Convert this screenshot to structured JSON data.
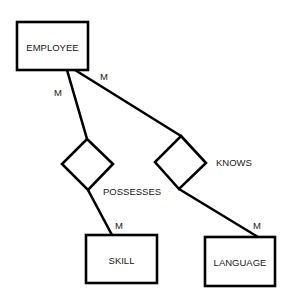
{
  "diagram": {
    "type": "er-diagram",
    "stroke_color": "#000000",
    "text_color": "#1a1a1a",
    "background": "#ffffff",
    "entities": [
      {
        "id": "employee",
        "label": "EMPLOYEE",
        "x": 17,
        "y": 22,
        "w": 71,
        "h": 48
      },
      {
        "id": "skill",
        "label": "SKILL",
        "x": 86,
        "y": 235,
        "w": 71,
        "h": 48
      },
      {
        "id": "language",
        "label": "LANGUAGE",
        "x": 205,
        "y": 237,
        "w": 70,
        "h": 49
      }
    ],
    "relationships": [
      {
        "id": "possesses",
        "label": "POSSESSES",
        "top": [
          87,
          139
        ],
        "right": [
          113,
          164
        ],
        "bottom": [
          88,
          190
        ],
        "left": [
          62,
          164
        ],
        "label_pos": [
          103,
          191
        ]
      },
      {
        "id": "knows",
        "label": "KNOWS",
        "top": [
          181,
          136
        ],
        "right": [
          206,
          163
        ],
        "bottom": [
          179,
          189
        ],
        "left": [
          155,
          162
        ],
        "label_pos": [
          216,
          162
        ]
      }
    ],
    "connections": [
      {
        "id": "employee-possesses",
        "from": [
          67,
          70
        ],
        "to": [
          87,
          139
        ]
      },
      {
        "id": "employee-knows",
        "from": [
          75,
          70
        ],
        "to": [
          181,
          136
        ]
      },
      {
        "id": "possesses-skill",
        "from": [
          88,
          190
        ],
        "to": [
          112,
          235
        ]
      },
      {
        "id": "knows-language",
        "from": [
          179,
          189
        ],
        "to": [
          258,
          237
        ]
      }
    ],
    "cardinalities": [
      {
        "id": "card-employee-possesses",
        "label": "M",
        "x": 58,
        "y": 92
      },
      {
        "id": "card-employee-knows",
        "label": "M",
        "x": 104,
        "y": 76
      },
      {
        "id": "card-skill",
        "label": "M",
        "x": 119,
        "y": 225
      },
      {
        "id": "card-language",
        "label": "M",
        "x": 257,
        "y": 225
      }
    ]
  }
}
